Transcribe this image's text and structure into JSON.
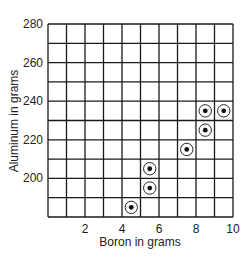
{
  "chart_data": {
    "type": "scatter",
    "title": "",
    "xlabel": "Boron in grams",
    "ylabel": "Aluminum in grams",
    "xlim": [
      0,
      10
    ],
    "ylim": [
      180,
      280
    ],
    "x_ticks": [
      2,
      4,
      6,
      8,
      10
    ],
    "y_ticks": [
      200,
      220,
      240,
      260,
      280
    ],
    "grid": true,
    "grid_x_step": 1,
    "grid_y_step": 10,
    "legend": null,
    "marker": "circled-dot",
    "series": [
      {
        "name": "points",
        "points": [
          {
            "x": 4.5,
            "y": 185
          },
          {
            "x": 5.5,
            "y": 195
          },
          {
            "x": 5.5,
            "y": 205
          },
          {
            "x": 7.5,
            "y": 215
          },
          {
            "x": 8.5,
            "y": 225
          },
          {
            "x": 8.5,
            "y": 235
          },
          {
            "x": 9.5,
            "y": 235
          }
        ]
      }
    ]
  },
  "colors": {
    "grid": "#1a1a1a",
    "marker": "#111111",
    "text": "#222222"
  }
}
